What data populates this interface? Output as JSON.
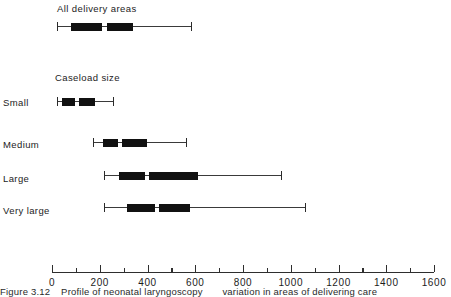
{
  "figure": {
    "caption_label": "Figure 3.12",
    "caption_text_1": "Profile of neonatal laryngoscopy",
    "caption_text_2": "variation in areas of delivering care"
  },
  "group_headers": {
    "all_areas": "All delivery areas",
    "caseload": "Caseload size"
  },
  "axis": {
    "min": 0,
    "max": 1600,
    "major_step": 200,
    "minor_step": 100,
    "tick_labels": [
      "0",
      "200",
      "400",
      "600",
      "800",
      "1000",
      "1200",
      "1400",
      "1600"
    ],
    "tick_values": [
      0,
      200,
      400,
      600,
      800,
      1000,
      1200,
      1400,
      1600
    ],
    "minor_values": [
      100,
      300,
      500,
      700,
      900,
      1100,
      1300,
      1500
    ]
  },
  "chart_data": {
    "type": "bar",
    "subtype": "box-and-whisker",
    "title": "",
    "xlabel": "",
    "ylabel": "",
    "xlim": [
      0,
      1600
    ],
    "grid": false,
    "legend": "none",
    "orientation": "horizontal",
    "categories": [
      "All delivery areas",
      "Small",
      "Medium",
      "Large",
      "Very large"
    ],
    "boxes": [
      {
        "label": "All delivery areas",
        "group": "All delivery areas",
        "whisker_low": 20,
        "q1": 80,
        "median": 222,
        "q3": 342,
        "whisker_high": 588
      },
      {
        "label": "Small",
        "group": "Caseload size",
        "whisker_low": 20,
        "q1": 42,
        "median": 108,
        "q3": 183,
        "whisker_high": 258
      },
      {
        "label": "Medium",
        "group": "Caseload size",
        "whisker_low": 171,
        "q1": 212,
        "median": 288,
        "q3": 404,
        "whisker_high": 567
      },
      {
        "label": "Large",
        "group": "Caseload size",
        "whisker_low": 217,
        "q1": 279,
        "median": 400,
        "q3": 617,
        "whisker_high": 963
      },
      {
        "label": "Very large",
        "group": "Caseload size",
        "whisker_low": 217,
        "q1": 313,
        "median": 442,
        "q3": 583,
        "whisker_high": 1063
      }
    ]
  }
}
